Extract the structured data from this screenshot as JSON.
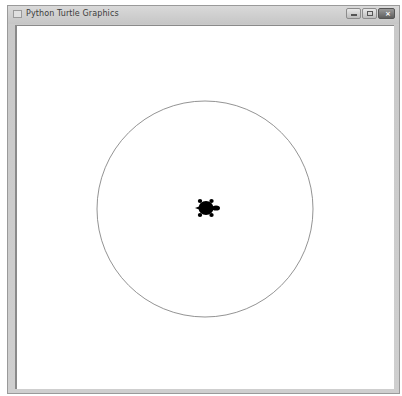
{
  "window": {
    "title": "Python Turtle Graphics",
    "controls": {
      "minimize": "minimize",
      "maximize": "maximize",
      "close": "close"
    }
  },
  "canvas": {
    "background": "#ffffff",
    "circle": {
      "cx": 205,
      "cy": 209,
      "r": 108,
      "stroke": "#777777"
    },
    "turtle": {
      "x": 206,
      "y": 208,
      "heading": "east",
      "color": "#000000"
    }
  }
}
